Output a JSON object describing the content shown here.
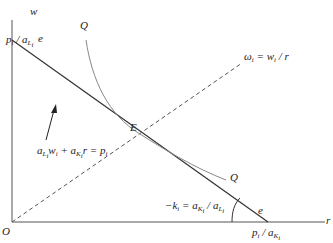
{
  "diagram": {
    "type": "economics-isoquant-unit-cost",
    "axes": {
      "x_label": "r",
      "y_label": "w",
      "origin_label": "O"
    },
    "lines": {
      "cost_line": {
        "name": "e",
        "end_label_top": "e",
        "end_label_bottom": "e",
        "equation": "a_Li w_i + a_Ki r = p_i",
        "y_intercept_label": "p_i / a_Li",
        "x_intercept_label": "p_i / a_Ki",
        "slope_label": "-k_i = a_Ki / a_Li"
      },
      "ray": {
        "style": "dashed",
        "label": "ω_i = w_i / r"
      },
      "isoquant": {
        "top_label": "Q",
        "bottom_label": "Q"
      }
    },
    "points": {
      "equilibrium": "E"
    },
    "colors": {
      "line": "#333333",
      "curve": "#888888",
      "text": "#222222"
    }
  }
}
